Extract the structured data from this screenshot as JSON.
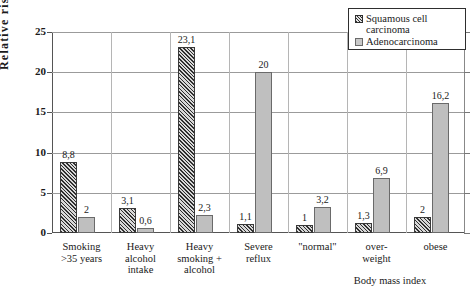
{
  "chart_data": {
    "type": "bar",
    "title": "",
    "xlabel": "",
    "ylabel": "Relative risk",
    "ylim": [
      0,
      25
    ],
    "yticks": [
      0,
      5,
      10,
      15,
      20,
      25
    ],
    "grid": true,
    "legend_position": "top-right",
    "categories": [
      "Smoking >35 years",
      "Heavy alcohol intake",
      "Heavy smoking + alcohol",
      "Severe reflux",
      "\"normal\"",
      "over-weight",
      "obese"
    ],
    "category_lines": [
      [
        "Smoking",
        ">35 years"
      ],
      [
        "Heavy",
        "alcohol",
        "intake"
      ],
      [
        "Heavy",
        "smoking +",
        "alcohol"
      ],
      [
        "Severe",
        "reflux"
      ],
      [
        "\"normal\""
      ],
      [
        "over-",
        "weight"
      ],
      [
        "obese"
      ]
    ],
    "group_annotation": "Body mass index",
    "series": [
      {
        "name": "Squamous cell carcinoma",
        "color": "#6e6e6e",
        "pattern": "diagonal-hatch",
        "values": [
          8.8,
          3.1,
          23.1,
          1.1,
          1,
          1.3,
          2
        ],
        "labels": [
          "8,8",
          "3,1",
          "23,1",
          "1,1",
          "1",
          "1,3",
          "2"
        ]
      },
      {
        "name": "Adenocarcinoma",
        "color": "#bfbfbf",
        "pattern": "solid",
        "values": [
          2,
          0.6,
          2.3,
          20,
          3.2,
          6.9,
          16.2
        ],
        "labels": [
          "2",
          "0,6",
          "2,3",
          "20",
          "3,2",
          "6,9",
          "16,2"
        ]
      }
    ]
  },
  "legend": {
    "items": [
      {
        "label_line1": "Squamous cell",
        "label_line2": "carcinoma"
      },
      {
        "label_line1": "Adenocarcinoma",
        "label_line2": ""
      }
    ]
  },
  "ytick_labels": [
    "0",
    "5",
    "10",
    "15",
    "20",
    "25"
  ],
  "caption": ""
}
